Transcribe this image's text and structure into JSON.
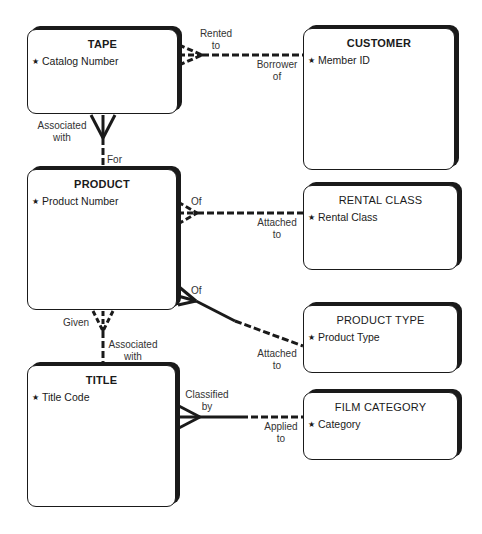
{
  "diagram": {
    "type": "entity-relationship",
    "colors": {
      "line": "#1a1a1a",
      "label": "#333333",
      "background": "#ffffff"
    },
    "entities": [
      {
        "id": "tape",
        "title": "TAPE",
        "title_bold": true,
        "attribute": "Catalog Number",
        "key_marker": "★",
        "box": [
          27,
          29,
          178,
          114
        ]
      },
      {
        "id": "customer",
        "title": "CUSTOMER",
        "title_bold": true,
        "attribute": "Member ID",
        "key_marker": "★",
        "box": [
          303,
          28,
          455,
          170
        ]
      },
      {
        "id": "product",
        "title": "PRODUCT",
        "title_bold": true,
        "attribute": "Product Number",
        "key_marker": "★",
        "box": [
          27,
          169,
          177,
          310
        ]
      },
      {
        "id": "rental_class",
        "title": "RENTAL CLASS",
        "title_bold": false,
        "attribute": "Rental Class",
        "key_marker": "★",
        "box": [
          303,
          185,
          458,
          270
        ]
      },
      {
        "id": "product_type",
        "title": "PRODUCT TYPE",
        "title_bold": false,
        "attribute": "Product Type",
        "key_marker": "★",
        "box": [
          303,
          305,
          458,
          373
        ]
      },
      {
        "id": "title",
        "title": "TITLE",
        "title_bold": true,
        "attribute": "Title Code",
        "key_marker": "★",
        "box": [
          27,
          365,
          176,
          507
        ]
      },
      {
        "id": "film_category",
        "title": "FILM CATEGORY",
        "title_bold": false,
        "attribute": "Category",
        "key_marker": "★",
        "box": [
          303,
          392,
          458,
          460
        ]
      }
    ],
    "relationships": [
      {
        "id": "tape_customer",
        "from": "tape",
        "to": "customer",
        "from_label": [
          "Rented",
          "to"
        ],
        "to_label": [
          "Borrower",
          "of"
        ],
        "from_cardinality": "many-optional",
        "to_cardinality": "one-optional"
      },
      {
        "id": "tape_product",
        "from": "tape",
        "to": "product",
        "from_label": [
          "Associated",
          "with"
        ],
        "to_label": [
          "For"
        ],
        "from_cardinality": "many-mandatory",
        "to_cardinality": "one-optional"
      },
      {
        "id": "product_rental_class",
        "from": "product",
        "to": "rental_class",
        "from_label": [
          "Of"
        ],
        "to_label": [
          "Attached",
          "to"
        ],
        "from_cardinality": "many-optional",
        "to_cardinality": "one-optional"
      },
      {
        "id": "product_product_type",
        "from": "product",
        "to": "product_type",
        "from_label": [
          "Of"
        ],
        "to_label": [
          "Attached",
          "to"
        ],
        "from_cardinality": "many-mandatory",
        "to_cardinality": "one-optional"
      },
      {
        "id": "product_title",
        "from": "product",
        "to": "title",
        "from_label": [
          "Given"
        ],
        "to_label": [
          "Associated",
          "with"
        ],
        "from_cardinality": "many-optional",
        "to_cardinality": "one-optional"
      },
      {
        "id": "title_film_category",
        "from": "title",
        "to": "film_category",
        "from_label": [
          "Classified",
          "by"
        ],
        "to_label": [
          "Applied",
          "to"
        ],
        "from_cardinality": "many-mandatory",
        "to_cardinality": "one-optional"
      }
    ]
  }
}
